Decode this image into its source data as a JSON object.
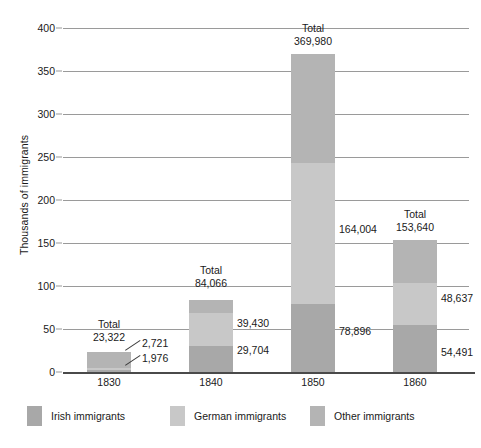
{
  "chart_data": {
    "type": "bar",
    "subtype": "stacked-bar",
    "title": "",
    "xlabel": "",
    "ylabel": "Thousands of immigrants",
    "categories": [
      "1830",
      "1840",
      "1850",
      "1860"
    ],
    "ylim": [
      0,
      400
    ],
    "yticks": [
      0,
      50,
      100,
      150,
      200,
      250,
      300,
      350,
      400
    ],
    "ytick_labels": [
      "0",
      "50",
      "100",
      "150",
      "200",
      "250",
      "300",
      "350",
      "400"
    ],
    "grid": true,
    "units": "thousands of immigrants",
    "legend_position": "bottom",
    "series": [
      {
        "name": "Irish immigrants",
        "color": "#a8a8a8",
        "values": [
          2.721,
          29.704,
          78.896,
          54.491
        ],
        "value_labels": [
          "2,721",
          "29,704",
          "78,896",
          "54,491"
        ]
      },
      {
        "name": "German immigrants",
        "color": "#c8c8c8",
        "values": [
          1.976,
          39.43,
          164.004,
          48.637
        ],
        "value_labels": [
          "1,976",
          "39,430",
          "164,004",
          "48,637"
        ]
      },
      {
        "name": "Other immigrants",
        "color": "#b4b4b4",
        "values": [
          18.625,
          14.932,
          127.08,
          50.512
        ],
        "value_labels": [
          "",
          "",
          "",
          ""
        ]
      }
    ],
    "totals": [
      23.322,
      84.066,
      369.98,
      153.64
    ],
    "total_labels": [
      "23,322",
      "84,066",
      "369,980",
      "153,640"
    ],
    "total_caption": "Total"
  },
  "axis": {
    "y_title": "Thousands of immigrants",
    "y_ticks": [
      {
        "label": "400",
        "value": 400
      },
      {
        "label": "350",
        "value": 350
      },
      {
        "label": "300",
        "value": 300
      },
      {
        "label": "250",
        "value": 250
      },
      {
        "label": "200",
        "value": 200
      },
      {
        "label": "150",
        "value": 150
      },
      {
        "label": "100",
        "value": 100
      },
      {
        "label": "50",
        "value": 50
      },
      {
        "label": "0",
        "value": 0
      }
    ],
    "x_ticks": [
      {
        "label": "1830"
      },
      {
        "label": "1840"
      },
      {
        "label": "1850"
      },
      {
        "label": "1860"
      }
    ]
  },
  "annotations": {
    "total_word": "Total",
    "g1830": {
      "total": "23,322",
      "irish": "2,721",
      "german": "1,976"
    },
    "g1840": {
      "total": "84,066",
      "german": "39,430",
      "irish": "29,704"
    },
    "g1850": {
      "total": "369,980",
      "german": "164,004",
      "irish": "78,896"
    },
    "g1860": {
      "total": "153,640",
      "german": "48,637",
      "irish": "54,491"
    }
  },
  "legend": {
    "items": [
      {
        "label": "Irish immigrants",
        "color": "#a8a8a8"
      },
      {
        "label": "German immigrants",
        "color": "#c8c8c8"
      },
      {
        "label": "Other immigrants",
        "color": "#b4b4b4"
      }
    ]
  }
}
